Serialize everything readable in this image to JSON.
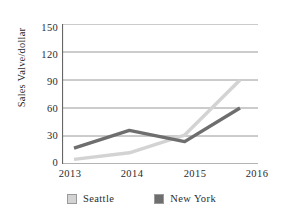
{
  "chart_data": {
    "type": "line",
    "title": "",
    "xlabel": "",
    "ylabel": "Sales  Valve/dollar",
    "categories": [
      "2013",
      "2014",
      "2015",
      "2016"
    ],
    "yticks": [
      "150",
      "120",
      "90",
      "60",
      "30",
      "0"
    ],
    "ylim": [
      0,
      150
    ],
    "grid": true,
    "legend_position": "bottom",
    "series": [
      {
        "name": "Seattle",
        "color": "#d3d3d3",
        "values": [
          5,
          12,
          31,
          90
        ]
      },
      {
        "name": "New  York",
        "color": "#6e6e6e",
        "values": [
          17,
          36,
          24,
          60
        ]
      }
    ]
  },
  "axis": {
    "line_color": "#666666",
    "grid_color": "#8c8c8c"
  }
}
